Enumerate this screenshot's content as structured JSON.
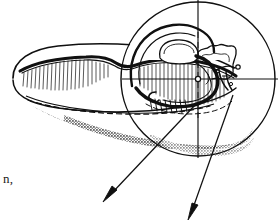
{
  "figure": {
    "kind": "scientific-line-drawing",
    "background_color": "#ffffff",
    "ink_color": "#101010",
    "shadow_tone_color": "#8d8d8d",
    "width": 278,
    "height": 222,
    "caption_fragment": "n,",
    "inset": {
      "label": "circular-magnifier-inset",
      "center_x": 198,
      "center_y": 79,
      "radius": 77,
      "stroke_width": 1.4,
      "crosshair": {
        "horizontal_y": 79,
        "vertical_x": 198,
        "node_radius": 2.6,
        "node_fill": "#ffffff"
      }
    },
    "body": {
      "label": "elongated-specimen-body",
      "left_tip_x": 12,
      "right_x": 236,
      "top_y": 46,
      "bottom_y": 116
    },
    "leaders": [
      {
        "name": "leader-arrow-left",
        "from_x": 196,
        "from_y": 104,
        "to_x": 104,
        "to_y": 202
      },
      {
        "name": "leader-arrow-right",
        "from_x": 232,
        "from_y": 96,
        "to_x": 189,
        "to_y": 219
      }
    ],
    "features": [
      "thick-dorsal-ridge",
      "fine-vertical-hatching",
      "dashed-hidden-edge",
      "stippled-cast-shadow",
      "lobed-internal-contours",
      "paired-hook-spines"
    ]
  }
}
